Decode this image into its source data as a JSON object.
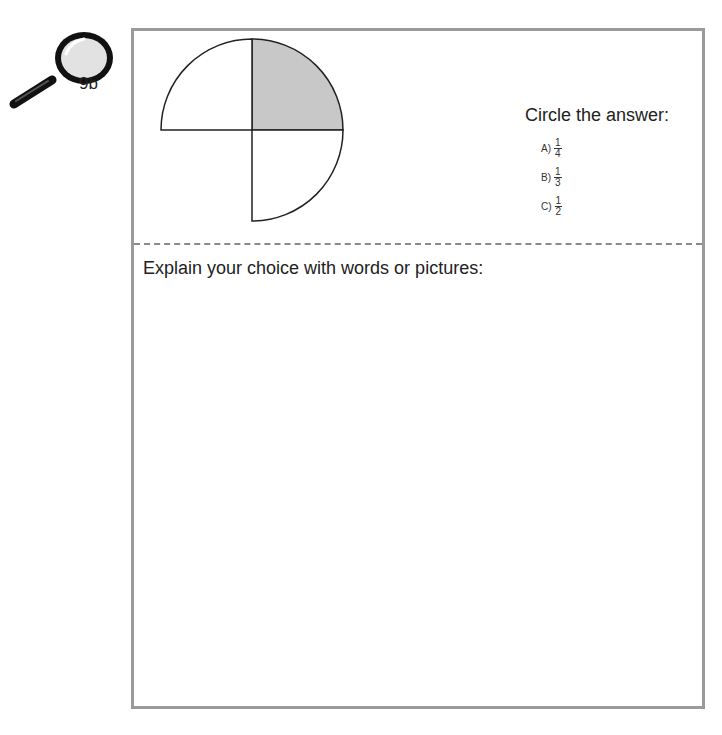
{
  "badge": {
    "label": "9b",
    "icon": "magnifying-glass-icon"
  },
  "figure": {
    "shaded_color": "#c8c8c8",
    "stroke_color": "#222222"
  },
  "question": {
    "prompt": "Circle the answer:",
    "options": [
      {
        "letter": "A)",
        "numerator": "1",
        "denominator": "4"
      },
      {
        "letter": "B)",
        "numerator": "1",
        "denominator": "3"
      },
      {
        "letter": "C)",
        "numerator": "1",
        "denominator": "2"
      }
    ]
  },
  "explanation": {
    "prompt": "Explain your choice with words or pictures:"
  }
}
